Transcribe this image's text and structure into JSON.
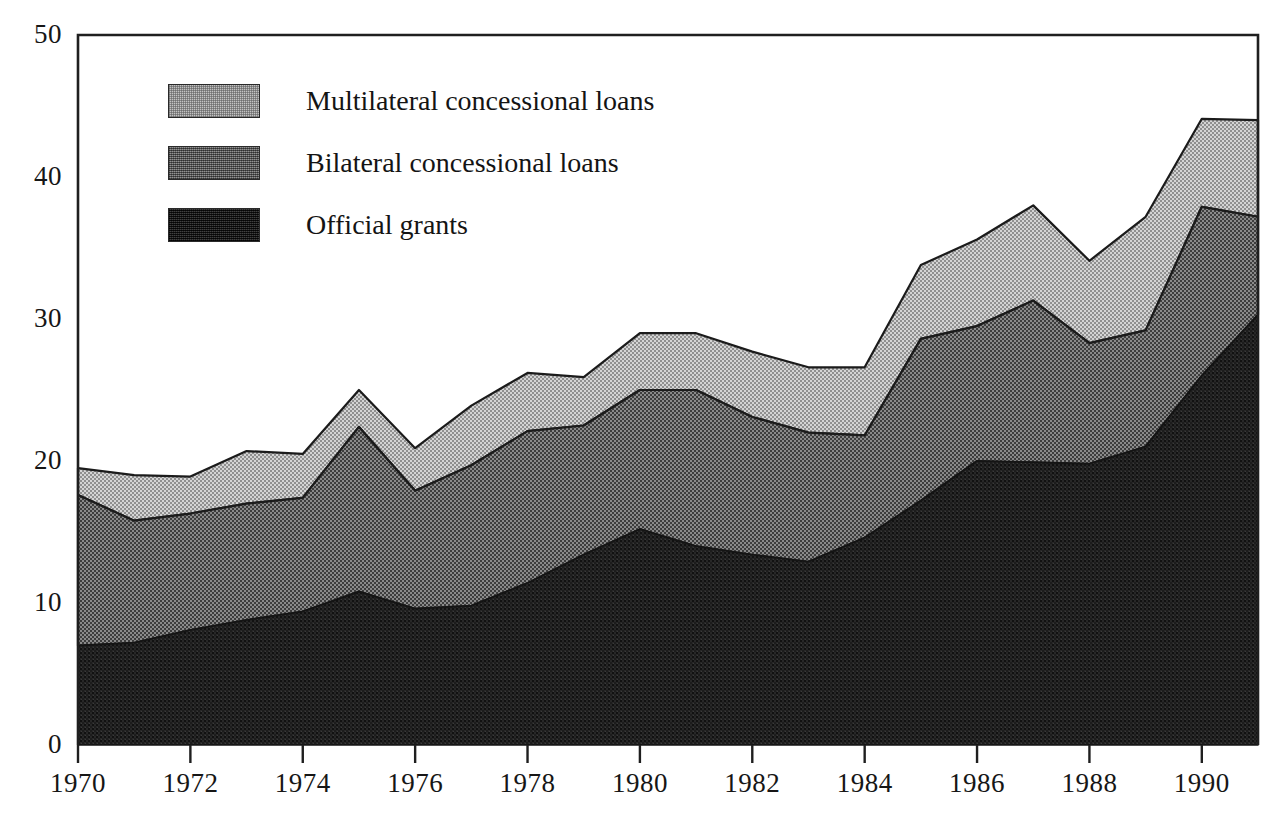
{
  "chart_data": {
    "type": "area",
    "stacked": true,
    "title": "",
    "subtitle": "",
    "xlabel": "",
    "ylabel": "",
    "grid": false,
    "legend_position": "top-left",
    "x": [
      1970,
      1971,
      1972,
      1973,
      1974,
      1975,
      1976,
      1977,
      1978,
      1979,
      1980,
      1981,
      1982,
      1983,
      1984,
      1985,
      1986,
      1987,
      1988,
      1989,
      1990,
      1991
    ],
    "xlim": [
      1970,
      1991
    ],
    "ylim": [
      0,
      50
    ],
    "xticks": [
      "1970",
      "1972",
      "1974",
      "1976",
      "1978",
      "1980",
      "1982",
      "1984",
      "1986",
      "1988",
      "1990"
    ],
    "xtick_values": [
      1970,
      1972,
      1974,
      1976,
      1978,
      1980,
      1982,
      1984,
      1986,
      1988,
      1990
    ],
    "yticks": [
      "0",
      "10",
      "20",
      "30",
      "40",
      "50"
    ],
    "ytick_values": [
      0,
      10,
      20,
      30,
      40,
      50
    ],
    "series": [
      {
        "name": "Official grants",
        "color": "#2b2b2b",
        "values": [
          7.0,
          7.2,
          8.1,
          8.8,
          9.4,
          10.8,
          9.6,
          9.8,
          11.4,
          13.4,
          15.2,
          14.0,
          13.4,
          12.9,
          14.6,
          17.2,
          20.0,
          19.9,
          19.8,
          21.0,
          26.0,
          30.3
        ]
      },
      {
        "name": "Bilateral concessional loans",
        "color": "#6e6e6e",
        "values": [
          10.6,
          8.6,
          8.2,
          8.2,
          8.0,
          11.6,
          8.3,
          9.9,
          10.7,
          9.1,
          9.8,
          11.0,
          9.7,
          9.1,
          7.2,
          11.4,
          9.5,
          11.4,
          8.5,
          8.2,
          11.9,
          6.9
        ]
      },
      {
        "name": "Multilateral concessional loans",
        "color": "#c3c3c3",
        "values": [
          1.9,
          3.2,
          2.6,
          3.7,
          3.1,
          2.6,
          3.0,
          4.2,
          4.1,
          3.4,
          4.0,
          4.0,
          4.6,
          4.6,
          4.8,
          5.2,
          6.1,
          6.7,
          5.8,
          8.0,
          6.2,
          6.8
        ]
      }
    ],
    "totals": [
      19.5,
      19.0,
      18.9,
      20.7,
      20.5,
      25.0,
      20.9,
      23.9,
      26.2,
      25.9,
      29.0,
      29.0,
      27.7,
      26.6,
      26.6,
      33.8,
      35.6,
      38.0,
      34.1,
      37.2,
      44.1,
      44.0
    ]
  },
  "legend": {
    "items": [
      {
        "label": "Multilateral concessional loans",
        "swatch": "fill-multilateral"
      },
      {
        "label": "Bilateral concessional loans",
        "swatch": "fill-bilateral"
      },
      {
        "label": "Official grants",
        "swatch": "fill-grants"
      }
    ]
  },
  "axes": {
    "frame_color": "#1f1f1f",
    "background": "#ffffff"
  }
}
